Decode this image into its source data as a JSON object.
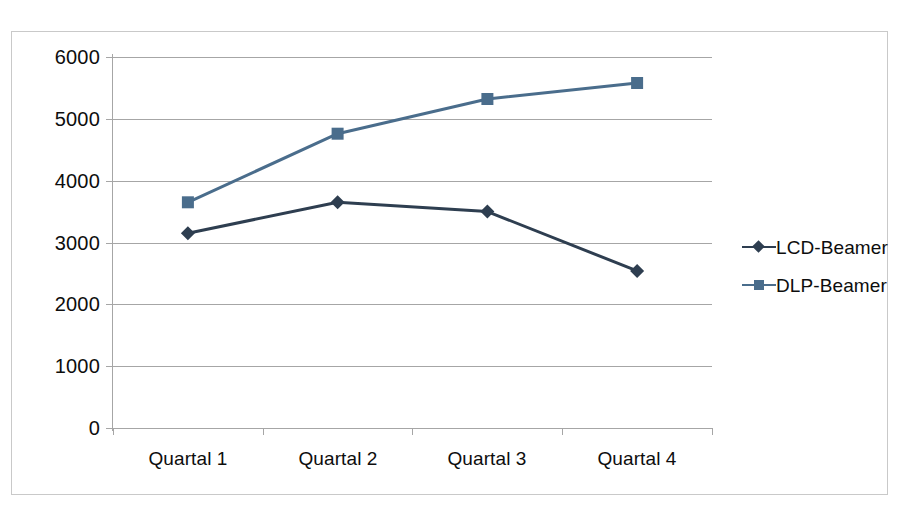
{
  "chart_data": {
    "type": "line",
    "title": "",
    "subtitle": "",
    "xlabel": "",
    "ylabel": "",
    "categories": [
      "Quartal 1",
      "Quartal 2",
      "Quartal 3",
      "Quartal 4"
    ],
    "series": [
      {
        "name": "LCD-Beamer",
        "color": "#2E3E50",
        "marker": "diamond",
        "values": [
          3150,
          3650,
          3500,
          2540
        ]
      },
      {
        "name": "DLP-Beamer",
        "color": "#4A6D8C",
        "marker": "square",
        "values": [
          3650,
          4760,
          5320,
          5580
        ]
      }
    ],
    "ylim": [
      0,
      6000
    ],
    "y_ticks": [
      "0",
      "1000",
      "2000",
      "3000",
      "4000",
      "5000",
      "6000"
    ],
    "y_tick_values": [
      0,
      1000,
      2000,
      3000,
      4000,
      5000,
      6000
    ],
    "grid": true,
    "legend_position": "right",
    "colors": {
      "gridline": "#a6a6a6",
      "frame_border": "#c9c9c9",
      "text": "#0d0d0d",
      "background": "#ffffff"
    }
  },
  "legend": {
    "entries": [
      {
        "label": "LCD-Beamer"
      },
      {
        "label": "DLP-Beamer"
      }
    ]
  },
  "axis": {
    "y_labels": [
      "6000",
      "5000",
      "4000",
      "3000",
      "2000",
      "1000",
      "0"
    ],
    "x_labels": [
      "Quartal 1",
      "Quartal 2",
      "Quartal 3",
      "Quartal 4"
    ]
  }
}
